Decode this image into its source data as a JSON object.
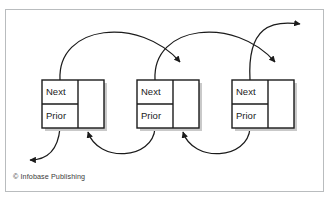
{
  "figure": {
    "credit": "© Infobase Publishing",
    "background_color": "#ffffff",
    "frame_color": "#b9bcbe",
    "line_color": "#1b1b1b",
    "box_fill": "#ffffff",
    "box_stroke": "#1b1b1b",
    "shadow_color": "#c9c9c9",
    "text_color": "#1b1b1b"
  },
  "diagram": {
    "type": "doubly-linked-list",
    "node_count": 3,
    "nodes": [
      {
        "index": 0,
        "next_label": "Next",
        "prior_label": "Prior",
        "data_label": "",
        "x": 42,
        "y": 80,
        "width": 62,
        "height": 48,
        "split_x": 78,
        "split_y": 104
      },
      {
        "index": 1,
        "next_label": "Next",
        "prior_label": "Prior",
        "data_label": "",
        "x": 137,
        "y": 80,
        "width": 62,
        "height": 48,
        "split_x": 173,
        "split_y": 104
      },
      {
        "index": 2,
        "next_label": "Next",
        "prior_label": "Prior",
        "data_label": "",
        "x": 232,
        "y": 80,
        "width": 62,
        "height": 48,
        "split_x": 268,
        "split_y": 104
      }
    ],
    "next_arcs": [
      {
        "name": "next-arc-node1-to-node2",
        "path": "M 60 80 C 57 24 140 16 180 64",
        "arrow": "down",
        "tip_x": 180,
        "tip_y": 79
      },
      {
        "name": "next-arc-node2-to-node3",
        "path": "M 155 80 C 152 24 235 16 275 64",
        "arrow": "down",
        "tip_x": 275,
        "tip_y": 79
      },
      {
        "name": "next-arc-node3-to-tail",
        "path": "M 250 80 C 247 24 275 20 303 24",
        "arrow": "right",
        "tip_x": 307,
        "tip_y": 24
      }
    ],
    "prior_arcs": [
      {
        "name": "prior-arc-node1-to-head",
        "path": "M 60 128 C 58 150 48 160 31 160",
        "arrow": "left",
        "tip_x": 27,
        "tip_y": 160
      },
      {
        "name": "prior-arc-node2-to-node1",
        "path": "M 155 128 C 153 160 98 162 88 134",
        "arrow": "up",
        "tip_x": 88,
        "tip_y": 129
      },
      {
        "name": "prior-arc-node3-to-node2",
        "path": "M 250 128 C 248 160 193 162 183 134",
        "arrow": "up",
        "tip_x": 183,
        "tip_y": 129
      }
    ]
  }
}
